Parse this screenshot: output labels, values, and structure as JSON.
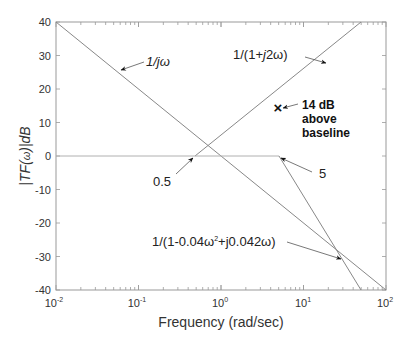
{
  "chart_data": {
    "type": "line",
    "title": "",
    "xlabel": "Frequency (rad/sec)",
    "ylabel": "|TF(ω)|dB",
    "xscale": "log",
    "xlim": [
      0.01,
      100
    ],
    "ylim": [
      -40,
      40
    ],
    "grid": false,
    "legend": null,
    "x_ticks": [
      {
        "value": 0.01,
        "base": "10",
        "exp": "-2"
      },
      {
        "value": 0.1,
        "base": "10",
        "exp": "-1"
      },
      {
        "value": 1,
        "base": "10",
        "exp": "0"
      },
      {
        "value": 10,
        "base": "10",
        "exp": "1"
      },
      {
        "value": 100,
        "base": "10",
        "exp": "2"
      }
    ],
    "y_ticks": [
      "40",
      "30",
      "20",
      "10",
      "0",
      "-10",
      "-20",
      "-30",
      "-40"
    ],
    "series": [
      {
        "name": "1/jω",
        "x": [
          0.01,
          100
        ],
        "y": [
          40,
          -40
        ],
        "color": "#888888"
      },
      {
        "name": "1/(1+j2ω)",
        "x": [
          0.5,
          50
        ],
        "y": [
          0,
          40
        ],
        "color": "#888888"
      },
      {
        "name": "baseline",
        "x": [
          0.01,
          5
        ],
        "y": [
          0,
          0
        ],
        "color": "#aaaaaa"
      },
      {
        "name": "1/(1-0.04ω²+j0.042ω)",
        "x": [
          5,
          50
        ],
        "y": [
          0,
          -40
        ],
        "color": "#888888"
      }
    ],
    "markers": [
      {
        "symbol": "×",
        "x": 5,
        "y": 14
      }
    ],
    "annotations": [
      {
        "text": "1/jω",
        "points_to": [
          0.063,
          25
        ]
      },
      {
        "text": "1/(1+j2ω)",
        "points_to": [
          20,
          31
        ]
      },
      {
        "text": "14 dB above baseline",
        "points_to": [
          5,
          14
        ]
      },
      {
        "text": "0.5",
        "points_to": [
          0.5,
          0
        ]
      },
      {
        "text": "5",
        "points_to": [
          5,
          0
        ]
      },
      {
        "text": "1/(1-0.04ω²+j0.042ω)",
        "points_to": [
          30,
          -31
        ]
      }
    ]
  },
  "labels": {
    "xlabel": "Frequency (rad/sec)",
    "ylabel_main": "|TF(",
    "ylabel_omega": "ω",
    "ylabel_end": ")|dB",
    "ann_jw": "1/jω",
    "ann_pole_pre": "1/(1+",
    "ann_pole_j": "j",
    "ann_pole_post": "2ω)",
    "ann_14db_line1": "14 dB",
    "ann_14db_line2": "above",
    "ann_14db_line3": "baseline",
    "ann_05": "0.5",
    "ann_5": "5",
    "ann_quad_pre": "1/(1-0.04ω",
    "ann_quad_sup": "2",
    "ann_quad_post": "+j0.042ω)",
    "marker": "×"
  }
}
